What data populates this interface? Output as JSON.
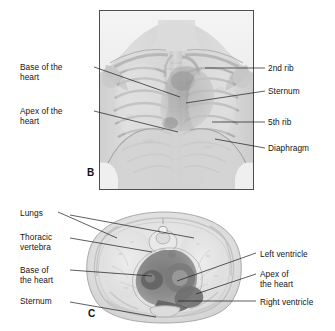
{
  "figure": {
    "panels": [
      {
        "letter": "B",
        "view": "anterior chest radiograph / 3D reconstruction",
        "labels_left": [
          {
            "name": "base-of-the-heart",
            "text": "Base of the\nheart"
          },
          {
            "name": "apex-of-the-heart",
            "text": "Apex of the\nheart"
          }
        ],
        "labels_right": [
          {
            "name": "second-rib",
            "text": "2nd rib"
          },
          {
            "name": "sternum",
            "text": "Sternum"
          },
          {
            "name": "fifth-rib",
            "text": "5th rib"
          },
          {
            "name": "diaphragm",
            "text": "Diaphragm"
          }
        ]
      },
      {
        "letter": "C",
        "view": "axial thoracic cross-section",
        "labels_left": [
          {
            "name": "lungs",
            "text": "Lungs"
          },
          {
            "name": "thoracic-vertebra",
            "text": "Thoracic\nvertebra"
          },
          {
            "name": "base-of-the-heart",
            "text": "Base of\nthe heart"
          },
          {
            "name": "sternum",
            "text": "Sternum"
          }
        ],
        "labels_right": [
          {
            "name": "left-ventricle",
            "text": "Left ventricle"
          },
          {
            "name": "apex-of-the-heart",
            "text": "Apex of\nthe heart"
          },
          {
            "name": "right-ventricle",
            "text": "Right ventricle"
          }
        ]
      }
    ],
    "colors": {
      "text": "#141414",
      "leader_line": "#1a1a1a",
      "frame_border": "#4d4d4d",
      "background": "#ffffff",
      "tissue_light": "#e3e3e3",
      "tissue_mid": "#c4c4c4",
      "tissue_dark": "#8f8f8f",
      "heart_dark": "#6b6b6b"
    }
  }
}
